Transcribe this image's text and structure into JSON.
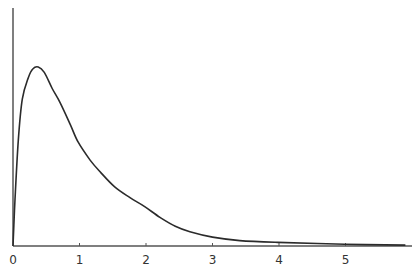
{
  "chart_data": {
    "type": "line",
    "title": "",
    "xlabel": "",
    "ylabel": "",
    "xlim": [
      0,
      5.9
    ],
    "ylim": [
      0,
      1.0
    ],
    "grid": false,
    "legend": null,
    "x_ticks": [
      "0",
      "1",
      "2",
      "3",
      "4",
      "5"
    ],
    "y_ticks": [],
    "series": [
      {
        "name": "density",
        "x": [
          0,
          0.03,
          0.08,
          0.14,
          0.23,
          0.3,
          0.38,
          0.47,
          0.59,
          0.71,
          0.86,
          0.98,
          1.16,
          1.32,
          1.53,
          1.76,
          1.98,
          2.21,
          2.44,
          2.66,
          3.0,
          3.41,
          3.98,
          4.99,
          5.9
        ],
        "y": [
          0.0,
          0.26,
          0.59,
          0.82,
          0.94,
          0.99,
          1.0,
          0.97,
          0.88,
          0.8,
          0.68,
          0.58,
          0.48,
          0.41,
          0.33,
          0.27,
          0.22,
          0.16,
          0.11,
          0.08,
          0.05,
          0.03,
          0.02,
          0.01,
          0.005
        ]
      }
    ],
    "line_color": "#2b2b2b"
  },
  "layout": {
    "origin_px": [
      13,
      246
    ],
    "px_per_x": 66.5,
    "px_per_y": 179,
    "y_axis_top_px": 8,
    "x_axis_right_px": 412
  }
}
